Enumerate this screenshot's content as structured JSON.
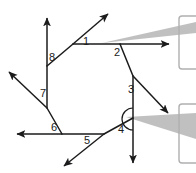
{
  "figure": {
    "name": "octagon-exterior-angles-diagram",
    "type": "geometry-diagram",
    "width": 196,
    "height": 173,
    "background_color": "#ffffff",
    "line_color": "#1b1b1b",
    "callout_color": "#a9a9a9",
    "callout_border_color": "#9e9e9e",
    "shape": "regular octagon with each side extended into a ray forming eight exterior angles",
    "octagon_vertices": [
      {
        "id": "v-top-left",
        "x": 73,
        "y": 44
      },
      {
        "id": "v-top-right",
        "x": 120,
        "y": 44
      },
      {
        "id": "v-right-upper",
        "x": 133,
        "y": 76
      },
      {
        "id": "v-right-lower",
        "x": 133,
        "y": 118
      },
      {
        "id": "v-bottom-right",
        "x": 104,
        "y": 134
      },
      {
        "id": "v-bottom-left",
        "x": 62,
        "y": 134
      },
      {
        "id": "v-left-lower",
        "x": 47,
        "y": 108
      },
      {
        "id": "v-left-upper",
        "x": 47,
        "y": 66
      }
    ],
    "arc_marker": {
      "name": "angle-arc-at-vertex-4",
      "center_x": 122,
      "center_y": 119,
      "radius": 11
    }
  },
  "labels": [
    {
      "id": "1",
      "text": "1",
      "x": 83,
      "y": 36
    },
    {
      "id": "2",
      "text": "2",
      "x": 114,
      "y": 47
    },
    {
      "id": "3",
      "text": "3",
      "x": 128,
      "y": 84
    },
    {
      "id": "4",
      "text": "4",
      "x": 118,
      "y": 124
    },
    {
      "id": "5",
      "text": "5",
      "x": 84,
      "y": 135
    },
    {
      "id": "6",
      "text": "6",
      "x": 51,
      "y": 122
    },
    {
      "id": "7",
      "text": "7",
      "x": 40,
      "y": 88
    },
    {
      "id": "8",
      "text": "8",
      "x": 49,
      "y": 52
    }
  ],
  "callouts": [
    {
      "id": "callout-upper",
      "name": "callout-pointer-upper",
      "tip_x": 102,
      "tip_y": 43,
      "target_label": "1"
    },
    {
      "id": "callout-lower",
      "name": "callout-pointer-lower",
      "tip_x": 126,
      "tip_y": 117,
      "target_label": "4"
    }
  ]
}
